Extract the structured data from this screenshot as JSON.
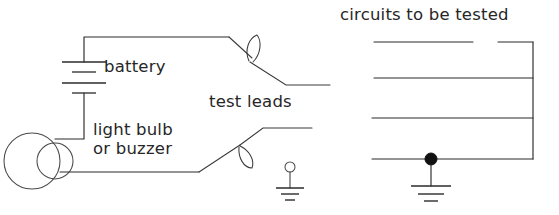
{
  "figure": {
    "background_color": "#ffffff",
    "ink_color": "#2b2b2b",
    "width": 559,
    "height": 215
  },
  "labels": {
    "battery": "battery",
    "light_bulb_or_buzzer": "light bulb\nor buzzer",
    "test_leads": "test leads",
    "circuits_to_be_tested": "circuits to be tested"
  },
  "components": {
    "battery": {
      "name": "battery",
      "symbol": "battery-cells",
      "plate_count": 4,
      "cells": 2
    },
    "indicator": {
      "name": "light bulb or buzzer",
      "symbol": "bulb-buzzer-circles",
      "circle_count": 2
    },
    "test_lead_upper": {
      "name": "upper test lead",
      "symbol": "probe-with-loop"
    },
    "test_lead_lower": {
      "name": "lower test lead",
      "symbol": "probe-with-loop"
    },
    "ground_small": {
      "name": "terminal ground",
      "symbol": "ground-with-terminal-circle",
      "bar_count": 3
    },
    "ground_circuit": {
      "name": "circuit ground",
      "symbol": "ground",
      "bar_count": 3
    },
    "junction": {
      "name": "junction node",
      "symbol": "filled-dot"
    },
    "circuits_under_test": {
      "name": "circuits to be tested",
      "horizontal_line_count": 4,
      "has_right_vertical_bus": true,
      "top_line_has_gap": true
    }
  }
}
